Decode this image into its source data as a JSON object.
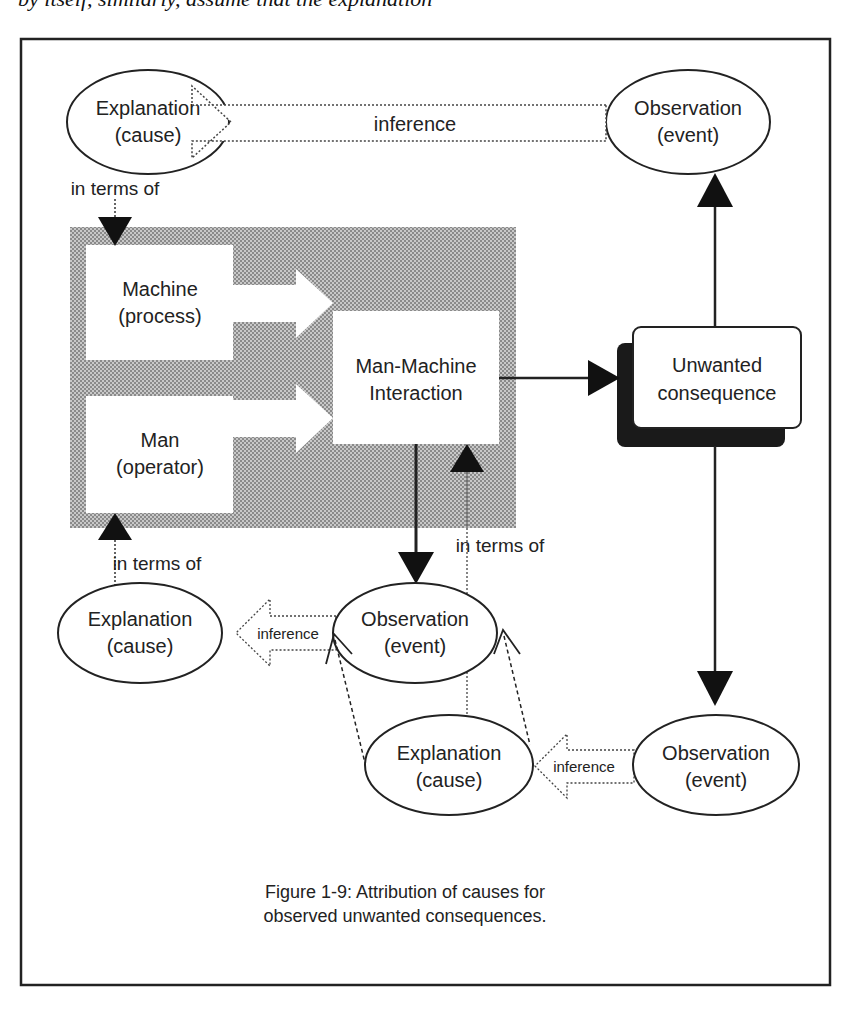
{
  "page_header_fragment": "by itself, similarly, assume that the explanation",
  "figure": {
    "caption_line1": "Figure 1-9: Attribution of causes for",
    "caption_line2": "observed unwanted consequences."
  },
  "nodes": {
    "explanation_top": {
      "line1": "Explanation",
      "line2": "(cause)"
    },
    "observation_top": {
      "line1": "Observation",
      "line2": "(event)"
    },
    "machine": {
      "line1": "Machine",
      "line2": "(process)"
    },
    "man": {
      "line1": "Man",
      "line2": "(operator)"
    },
    "interaction": {
      "line1": "Man-Machine",
      "line2": "Interaction"
    },
    "unwanted": {
      "line1": "Unwanted",
      "line2": "consequence"
    },
    "explanation_left": {
      "line1": "Explanation",
      "line2": "(cause)"
    },
    "observation_mid": {
      "line1": "Observation",
      "line2": "(event)"
    },
    "explanation_bottom": {
      "line1": "Explanation",
      "line2": "(cause)"
    },
    "observation_right": {
      "line1": "Observation",
      "line2": "(event)"
    }
  },
  "edges": {
    "inference_top": "inference",
    "inference_mid": "inference",
    "inference_bottom": "inference",
    "in_terms_of_top": "in terms of",
    "in_terms_of_left": "in terms of",
    "in_terms_of_mid": "in terms of"
  },
  "colors": {
    "frame": "#222222",
    "shade": "#a8a8a8",
    "ink": "#222222",
    "shadow": "#1a1a1a"
  }
}
